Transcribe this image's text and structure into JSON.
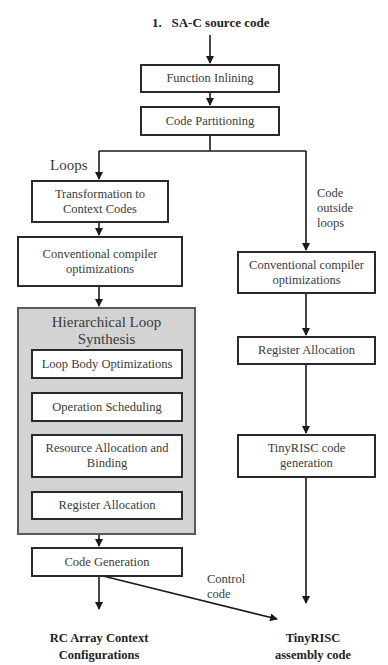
{
  "diagram": {
    "title": "1.   SA-C source code",
    "nodes": {
      "function_inlining": "Function Inlining",
      "code_partitioning": "Code Partitioning",
      "transformation": "Transformation to Context Codes",
      "conv_opt_left": "Conventional compiler optimizations",
      "hls_group_title": "Hierarchical Loop Synthesis",
      "loop_body_opt": "Loop Body Optimizations",
      "op_scheduling": "Operation Scheduling",
      "resource_alloc": "Resource Allocation and Binding",
      "reg_alloc_left": "Register Allocation",
      "code_generation": "Code Generation",
      "conv_opt_right": "Conventional compiler optimizations",
      "reg_alloc_right": "Register Allocation",
      "tinyrisc_codegen": "TinyRISC code generation"
    },
    "edge_labels": {
      "loops": "Loops",
      "outside_loops": "Code outside loops",
      "control_code": "Control code"
    },
    "outputs": {
      "rc_array": "RC Array Context Configurations",
      "tinyrisc_asm": "TinyRISC assembly code"
    },
    "colors": {
      "line": "#1a1a1a",
      "box_border": "#2a2a2a",
      "group_fill": "#d3d3d3",
      "text": "#3a3a3a"
    }
  }
}
